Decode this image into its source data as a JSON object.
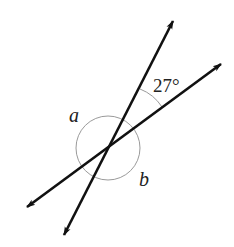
{
  "diagram": {
    "type": "intersecting-lines-angles",
    "labels": {
      "given_angle": "27°",
      "angle_a": "a",
      "angle_b": "b"
    },
    "colors": {
      "line": "#111111",
      "arc": "#9a9a9a",
      "text": "#222222"
    }
  }
}
